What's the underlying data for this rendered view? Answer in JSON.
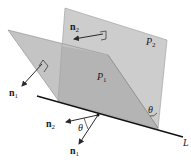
{
  "diagram": {
    "colors": {
      "background": "#ffffff",
      "plane_light": "#cdcdcd",
      "plane_overlap": "#b4b4b4",
      "plane_edge": "#8a8a8a",
      "line": "#111111",
      "vector": "#2a2a2a"
    },
    "planes": [
      {
        "id": "P2",
        "label_main": "P",
        "label_sub": "2"
      },
      {
        "id": "P1",
        "label_main": "P",
        "label_sub": "1"
      }
    ],
    "line": {
      "id": "L",
      "label": "L"
    },
    "vectors": [
      {
        "id": "n2_on_plane",
        "label_main": "n",
        "label_sub": "2"
      },
      {
        "id": "n1_on_plane",
        "label_main": "n",
        "label_sub": "1"
      },
      {
        "id": "n2_at_point",
        "label_main": "n",
        "label_sub": "2"
      },
      {
        "id": "n1_at_point",
        "label_main": "n",
        "label_sub": "1"
      }
    ],
    "angles": [
      {
        "id": "theta_normals",
        "label": "θ"
      },
      {
        "id": "theta_planes",
        "label": "θ"
      }
    ]
  }
}
